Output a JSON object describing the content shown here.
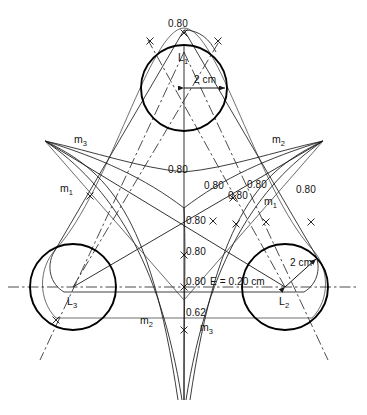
{
  "diagram": {
    "background_color": "#ffffff",
    "line_color": "#1a1a1a",
    "circles": [
      {
        "name": "L1",
        "label": "L",
        "subscript": "1",
        "cx": 184,
        "cy": 88,
        "r": 43,
        "radius_label": "2 cm"
      },
      {
        "name": "L2",
        "label": "L",
        "subscript": "2",
        "cx": 285,
        "cy": 287,
        "r": 43,
        "radius_label": "2 cm"
      },
      {
        "name": "L3",
        "label": "L",
        "subscript": "3",
        "cx": 73,
        "cy": 287,
        "r": 43
      }
    ],
    "curve_labels": [
      {
        "text": "m",
        "subscript": "3",
        "x": 74,
        "y": 134
      },
      {
        "text": "m",
        "subscript": "2",
        "x": 272,
        "y": 134
      },
      {
        "text": "m",
        "subscript": "1",
        "x": 60,
        "y": 183
      },
      {
        "text": "m",
        "subscript": "1",
        "x": 264,
        "y": 196
      },
      {
        "text": "m",
        "subscript": "2",
        "x": 140,
        "y": 315
      },
      {
        "text": "m",
        "subscript": "3",
        "x": 200,
        "y": 322
      }
    ],
    "dimension_labels": [
      {
        "text": "0.80",
        "x": 168,
        "y": 19
      },
      {
        "text": "0.80",
        "x": 168,
        "y": 165
      },
      {
        "text": "0.80",
        "x": 204,
        "y": 181
      },
      {
        "text": "0.80",
        "x": 247,
        "y": 180
      },
      {
        "text": "0.80",
        "x": 296,
        "y": 185
      },
      {
        "text": "0.80",
        "x": 228,
        "y": 191
      },
      {
        "text": "0.80",
        "x": 186,
        "y": 216
      },
      {
        "text": "0.80",
        "x": 186,
        "y": 247
      },
      {
        "text": "0.80",
        "x": 186,
        "y": 277
      },
      {
        "text": "0.62",
        "x": 186,
        "y": 315
      }
    ],
    "eccentricity_label": "E = 0.20 cm",
    "radius_labels": [
      "2 cm",
      "2 cm"
    ]
  }
}
